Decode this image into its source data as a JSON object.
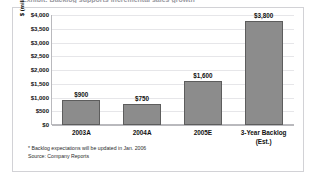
{
  "page": {
    "clipped_title_partial": "Exhibit: Backlog supports incremental sales growth"
  },
  "chart_data": {
    "type": "bar",
    "title": "",
    "xlabel": "",
    "ylabel": "$ (millions) of incremental sales",
    "categories": [
      "2003A",
      "2004A",
      "2005E",
      "3-Year Backlog\n(Est.)"
    ],
    "values": [
      900,
      750,
      1600,
      3800
    ],
    "value_labels": [
      "$900",
      "$750",
      "$1,600",
      "$3,800"
    ],
    "ylim": [
      0,
      4000
    ],
    "ytick_values": [
      0,
      500,
      1000,
      1500,
      2000,
      2500,
      3000,
      3500,
      4000
    ],
    "ytick_labels": [
      "$0",
      "$500",
      "$1,000",
      "$1,500",
      "$2,000",
      "$2,500",
      "$3,000",
      "$3,500",
      "$4,000"
    ],
    "grid": true,
    "legend": "none",
    "bar_color": "#8c8c8c",
    "bar_border_color": "#5d5d5d",
    "gridline_color": "#e6e6e9",
    "axis_color": "#b9b9bd"
  },
  "footnotes": [
    "* Backlog expectations will be updated in Jan. 2006",
    "Source: Company Reports"
  ]
}
